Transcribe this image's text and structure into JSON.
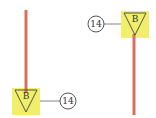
{
  "colors": {
    "line": "#d9715a",
    "box": "#f0ee6a",
    "stroke": "#444444",
    "connector": "#777777",
    "background": "#ffffff"
  },
  "symbols": [
    {
      "id": "left",
      "triangle_label": "B",
      "circle_label": "14",
      "orientation": "line-above"
    },
    {
      "id": "right",
      "triangle_label": "B",
      "circle_label": "14",
      "orientation": "line-below"
    }
  ]
}
